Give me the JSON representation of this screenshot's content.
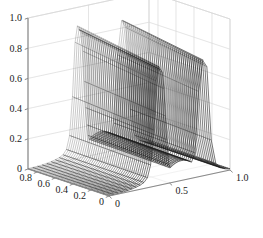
{
  "figure": {
    "background_color": "#ffffff",
    "grid_color": "#d8d8d8",
    "axis_color": "#8a8a8a",
    "mesh_color": "#1a1a1a",
    "tick_label_color": "#1a1a1a"
  },
  "chart_data": {
    "type": "surface",
    "title": "",
    "xlabel": "",
    "ylabel": "",
    "zlabel": "",
    "projection": "3d-mesh-wireframe",
    "grid": true,
    "legend": null,
    "xlim": [
      0,
      1
    ],
    "ylim": [
      0,
      0.9
    ],
    "zlim": [
      0,
      1
    ],
    "xticks": [
      0,
      0.5,
      1.0
    ],
    "xticklabels": [
      "0",
      "0.5",
      "1.0"
    ],
    "yticks": [
      0,
      0.2,
      0.4,
      0.6,
      0.8
    ],
    "yticklabels": [
      "0",
      "0.2",
      "0.4",
      "0.6",
      "0.8"
    ],
    "zticks": [
      0,
      0.2,
      0.4,
      0.6,
      0.8,
      1.0
    ],
    "zticklabels": [
      "0",
      "0.2",
      "0.4",
      "0.6",
      "0.8",
      "1.0"
    ],
    "surface": {
      "x_samples": 41,
      "y_samples": 41,
      "wall_positions_x": [
        0.42,
        0.78
      ],
      "valley_center_x": 0.6,
      "peak_height": 0.85,
      "valley_floor_height": 0.12,
      "baseline_height": 0.0
    }
  }
}
